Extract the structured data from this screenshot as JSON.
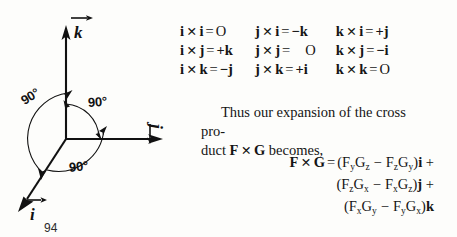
{
  "page": {
    "number": "94",
    "background_color": "#fdfdfb",
    "ink_color": "#151515"
  },
  "diagram": {
    "name": "right-handed-unit-vector-axes",
    "axes": [
      {
        "id": "k",
        "label": "k",
        "direction": "up",
        "has_vector_arrow": true
      },
      {
        "id": "j",
        "label": "j",
        "direction": "right",
        "has_vector_arrow": true
      },
      {
        "id": "i",
        "label": "i",
        "direction": "down-left",
        "has_vector_arrow": true
      }
    ],
    "origin": {
      "x": 66,
      "y": 139
    },
    "angles": [
      {
        "id": "angle-k-i",
        "label": "90°"
      },
      {
        "id": "angle-k-j",
        "label": "90°"
      },
      {
        "id": "angle-i-j",
        "label": "90°"
      }
    ]
  },
  "cross_table": {
    "name": "cross-product-multiplication-table",
    "rows": [
      [
        {
          "left": "i",
          "right": "i",
          "result": "O",
          "result_bold": false
        },
        {
          "left": "j",
          "right": "i",
          "result": "−k",
          "result_bold": true
        },
        {
          "left": "k",
          "right": "i",
          "result": "+j",
          "result_bold": true
        }
      ],
      [
        {
          "left": "i",
          "right": "j",
          "result": "+k",
          "result_bold": true
        },
        {
          "left": "j",
          "right": "j",
          "result": "O",
          "result_bold": false,
          "extra_gap": true
        },
        {
          "left": "k",
          "right": "j",
          "result": "−i",
          "result_bold": true
        }
      ],
      [
        {
          "left": "i",
          "right": "k",
          "result": "−j",
          "result_bold": true
        },
        {
          "left": "j",
          "right": "k",
          "result": "+i",
          "result_bold": true
        },
        {
          "left": "k",
          "right": "k",
          "result": "O",
          "result_bold": false
        }
      ]
    ],
    "operator": "✕",
    "equals": "="
  },
  "prose": {
    "line1_a": "Thus our expansion of the cross pro-",
    "line2_a": "duct ",
    "line2_f": "F",
    "line2_op": "✕",
    "line2_g": "G",
    "line2_b": " becomes,"
  },
  "formula": {
    "name": "cross-product-expansion",
    "lhs_f": "F",
    "lhs_op": "✕",
    "lhs_g": "G",
    "equals": "=",
    "rows": [
      {
        "open": "(",
        "t1_base": "F",
        "t1_sub": "y",
        "t2_base": "G",
        "t2_sub": "z",
        "minus": "−",
        "t3_base": "F",
        "t3_sub": "z",
        "t4_base": "G",
        "t4_sub": "y",
        "close": ")",
        "unit": "i",
        "trailer": " +"
      },
      {
        "open": "(",
        "t1_base": "F",
        "t1_sub": "z",
        "t2_base": "G",
        "t2_sub": "x",
        "minus": "−",
        "t3_base": "F",
        "t3_sub": "x",
        "t4_base": "G",
        "t4_sub": "z",
        "close": ")",
        "unit": "j",
        "trailer": " +"
      },
      {
        "open": "(",
        "t1_base": "F",
        "t1_sub": "x",
        "t2_base": "G",
        "t2_sub": "y",
        "minus": "−",
        "t3_base": "F",
        "t3_sub": "y",
        "t4_base": "G",
        "t4_sub": "x",
        "close": ")",
        "unit": "k",
        "trailer": ""
      }
    ]
  }
}
